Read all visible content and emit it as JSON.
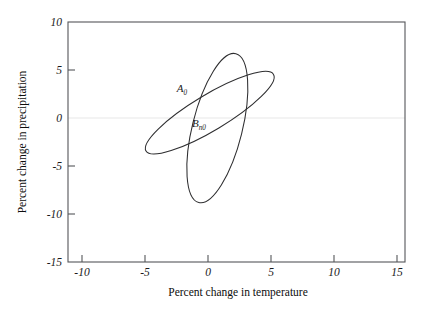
{
  "chart_data": {
    "type": "scatter",
    "title": "",
    "xlabel": "Percent change in temperature",
    "ylabel": "Percent change in precipitation",
    "xlim": [
      -12.5,
      16.5
    ],
    "ylim": [
      -15,
      10
    ],
    "xticks": [
      -10,
      -5,
      0,
      5,
      10,
      15
    ],
    "xtick_labels": [
      "-10",
      "-5",
      "0",
      "5",
      "10",
      "15"
    ],
    "yticks": [
      10,
      5,
      0,
      -5,
      -10,
      -15
    ],
    "ytick_labels": [
      "10",
      "5",
      "0",
      "-5",
      "-10",
      "-15"
    ],
    "grid": false,
    "legend": "none",
    "zero_line_y": 0,
    "zero_line_color": "#e7e7e7",
    "series": [
      {
        "name": "A_0",
        "label": "A",
        "label_subscript": "0",
        "shape": "ellipse",
        "center": [
          0.35,
          -1.05
        ],
        "semi_major": 6.6,
        "semi_minor": 2.6,
        "rotation_deg": 104,
        "label_position": [
          -2.1,
          2.2
        ],
        "color": "#2e2e30"
      },
      {
        "name": "B_n0",
        "label": "B",
        "label_subscript": "n0",
        "shape": "ellipse",
        "center": [
          -0.3,
          0.55
        ],
        "semi_major": 6.4,
        "semi_minor": 1.85,
        "rotation_deg": -31,
        "label_position": [
          -0.9,
          -0.55
        ],
        "color": "#2e2e30"
      }
    ]
  },
  "axes": {
    "x_title": "Percent change in temperature",
    "y_title": "Percent change in precipitation",
    "x_tick_labels": [
      "-10",
      "-5",
      "0",
      "5",
      "10",
      "15"
    ],
    "y_tick_labels": [
      "10",
      "5",
      "0",
      "-5",
      "-10",
      "-15"
    ]
  },
  "labels": {
    "a_main": "A",
    "a_sub": "0",
    "b_main": "B",
    "b_sub": "n0"
  }
}
